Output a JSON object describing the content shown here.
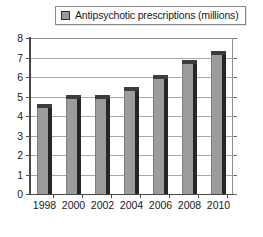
{
  "legend": {
    "swatch_icon": "legend-swatch-icon",
    "label": "Antipsychotic prescriptions (millions)",
    "swatch_color": "#9a9a9a"
  },
  "chart_data": {
    "type": "bar",
    "title": "",
    "xlabel": "",
    "ylabel": "",
    "categories": [
      "1998",
      "2000",
      "2002",
      "2004",
      "2006",
      "2008",
      "2010"
    ],
    "values": [
      4.6,
      5.1,
      5.1,
      5.5,
      6.1,
      6.85,
      7.35
    ],
    "series": [
      {
        "name": "Antipsychotic prescriptions (millions)",
        "values": [
          4.6,
          5.1,
          5.1,
          5.5,
          6.1,
          6.85,
          7.35
        ]
      }
    ],
    "ylim": [
      0,
      8
    ],
    "yticks": [
      "0",
      "1",
      "2",
      "3",
      "4",
      "5",
      "6",
      "7",
      "8"
    ],
    "grid": true,
    "legend_position": "top",
    "bar_color": "#9c9c9c",
    "bar_edge_color": "#262626"
  }
}
